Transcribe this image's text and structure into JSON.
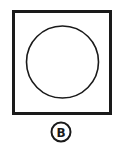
{
  "figure": {
    "label": "B",
    "shapes": {
      "outer": "square",
      "inner": "circle"
    },
    "stroke_color": "#1a1a1a",
    "background": "#ffffff"
  }
}
